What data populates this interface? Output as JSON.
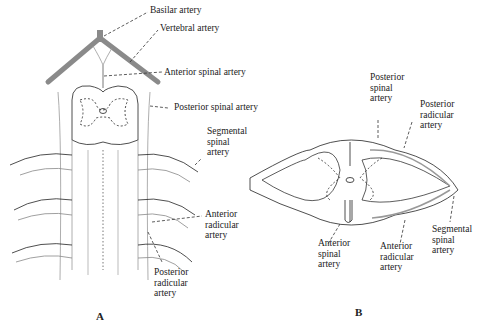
{
  "figure": {
    "panel_a": {
      "letter": "A",
      "labels": {
        "basilar": "Basilar artery",
        "vertebral": "Vertebral artery",
        "anterior_spinal": "Anterior spinal artery",
        "posterior_spinal": "Posterior spinal artery",
        "segmental_1": "Segmental",
        "segmental_2": "spinal",
        "segmental_3": "artery",
        "ant_radicular_1": "Anterior",
        "ant_radicular_2": "radicular",
        "ant_radicular_3": "artery",
        "post_radicular_1": "Posterior",
        "post_radicular_2": "radicular",
        "post_radicular_3": "artery"
      }
    },
    "panel_b": {
      "letter": "B",
      "labels": {
        "post_spinal_1": "Posterior",
        "post_spinal_2": "spinal",
        "post_spinal_3": "artery",
        "post_radicular_1": "Posterior",
        "post_radicular_2": "radicular",
        "post_radicular_3": "artery",
        "ant_spinal_1": "Anterior",
        "ant_spinal_2": "spinal",
        "ant_spinal_3": "artery",
        "ant_radicular_1": "Anterior",
        "ant_radicular_2": "radicular",
        "ant_radicular_3": "artery",
        "segmental_1": "Segmental",
        "segmental_2": "spinal",
        "segmental_3": "artery"
      }
    },
    "colors": {
      "vessel_gray": "#8a8a8a",
      "line": "#222222"
    }
  }
}
